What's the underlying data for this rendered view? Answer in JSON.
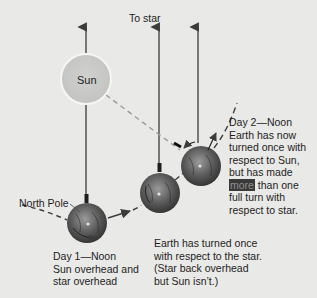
{
  "labels": {
    "to_star": "To star",
    "sun": "Sun",
    "north_pole": "North Pole",
    "day1": [
      "Day 1—Noon",
      "Sun overhead and",
      "star overhead"
    ],
    "middle": [
      "Earth has turned once",
      "with respect to the star.",
      "(Star back overhead",
      "but Sun isn’t.)"
    ],
    "day2_lines": [
      "Day 2—Noon",
      "Earth has now",
      "turned once with",
      "respect to Sun,",
      "but has made"
    ],
    "day2_highlight": "more",
    "day2_after_highlight": " than one",
    "day2_tail": [
      "full turn with",
      "respect to star."
    ]
  },
  "colors": {
    "background": "#e9e9e7",
    "sun_fill": "#c9c9c7",
    "sun_border": "#f4f4f2",
    "arrow": "#4a4a4a",
    "earth_dark": "#3e3e3e",
    "earth_light": "#8a8a8a",
    "highlight_bg": "#3a3a3a"
  },
  "elements": {
    "sun": {
      "cx": 86,
      "cy": 79,
      "r": 25
    },
    "earths": [
      {
        "name": "day1",
        "cx": 87,
        "cy": 223,
        "r": 20
      },
      {
        "name": "day1-plus-sidereal",
        "cx": 160,
        "cy": 193,
        "r": 20
      },
      {
        "name": "day2",
        "cx": 201,
        "cy": 166,
        "r": 20
      }
    ],
    "star_arrows_x": [
      86,
      159,
      198
    ]
  }
}
